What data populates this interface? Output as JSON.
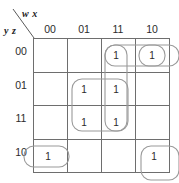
{
  "diagram": {
    "type": "karnaugh-map",
    "variables_top_label": "w x",
    "variables_left_label": "y z",
    "column_headers": [
      "00",
      "01",
      "11",
      "10"
    ],
    "row_headers": [
      "00",
      "01",
      "11",
      "10"
    ],
    "cells": [
      {
        "row": "00",
        "col": "00",
        "value": ""
      },
      {
        "row": "00",
        "col": "01",
        "value": ""
      },
      {
        "row": "00",
        "col": "11",
        "value": "1"
      },
      {
        "row": "00",
        "col": "10",
        "value": "1"
      },
      {
        "row": "01",
        "col": "00",
        "value": ""
      },
      {
        "row": "01",
        "col": "01",
        "value": "1"
      },
      {
        "row": "01",
        "col": "11",
        "value": "1"
      },
      {
        "row": "01",
        "col": "10",
        "value": ""
      },
      {
        "row": "11",
        "col": "00",
        "value": ""
      },
      {
        "row": "11",
        "col": "01",
        "value": "1"
      },
      {
        "row": "11",
        "col": "11",
        "value": "1"
      },
      {
        "row": "11",
        "col": "10",
        "value": ""
      },
      {
        "row": "10",
        "col": "00",
        "value": "1"
      },
      {
        "row": "10",
        "col": "01",
        "value": ""
      },
      {
        "row": "10",
        "col": "11",
        "value": ""
      },
      {
        "row": "10",
        "col": "10",
        "value": "1"
      }
    ],
    "groups": [
      {
        "name": "group-top-pair",
        "cells": [
          "00/11",
          "00/10"
        ]
      },
      {
        "name": "group-col11-vertical",
        "cells": [
          "00/11",
          "01/11",
          "11/11"
        ]
      },
      {
        "name": "group-center-quad",
        "cells": [
          "01/01",
          "01/11",
          "11/01",
          "11/11"
        ]
      },
      {
        "name": "group-top-right-wrap",
        "cells": [
          "00/10"
        ]
      },
      {
        "name": "group-bottom-left-wrap",
        "cells": [
          "10/00"
        ]
      },
      {
        "name": "group-bottom-right-wrap",
        "cells": [
          "10/10"
        ]
      }
    ],
    "colors": {
      "grid": "#6e6e6e",
      "group": "#9a9a9a",
      "text": "#2b2b2b",
      "background": "#ffffff"
    }
  }
}
